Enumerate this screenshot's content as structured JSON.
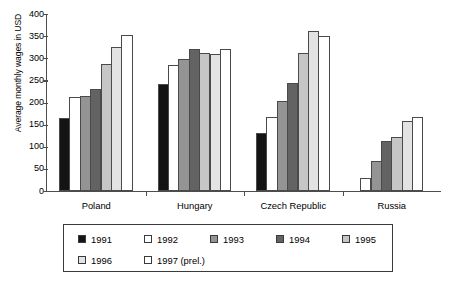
{
  "chart_data": {
    "type": "bar",
    "title": "",
    "subtitle": "",
    "xlabel": "",
    "ylabel": "Average monthly wages in USD",
    "ylim": [
      0,
      400
    ],
    "yticks": [
      0,
      50,
      100,
      150,
      200,
      250,
      300,
      350,
      400
    ],
    "grid": false,
    "legend_position": "bottom",
    "categories": [
      "Poland",
      "Hungary",
      "Czech Republic",
      "Russia"
    ],
    "series": [
      {
        "name": "1991",
        "color": "#141414",
        "values": [
          165,
          241,
          131,
          null
        ]
      },
      {
        "name": "1992",
        "color": "#ffffff",
        "values": [
          212,
          284,
          167,
          29
        ]
      },
      {
        "name": "1993",
        "color": "#949494",
        "values": [
          215,
          298,
          203,
          68
        ]
      },
      {
        "name": "1994",
        "color": "#636363",
        "values": [
          231,
          320,
          243,
          113
        ]
      },
      {
        "name": "1995",
        "color": "#c6c6c6",
        "values": [
          287,
          312,
          312,
          121
        ]
      },
      {
        "name": "1996",
        "color": "#e3e3e3",
        "values": [
          325,
          310,
          361,
          159
        ]
      },
      {
        "name": "1997 (prel.)",
        "color": "#ffffff",
        "values": [
          352,
          320,
          351,
          168
        ]
      }
    ]
  },
  "legend": {
    "items": [
      {
        "label": "1991",
        "color": "#141414"
      },
      {
        "label": "1992",
        "color": "#ffffff"
      },
      {
        "label": "1993",
        "color": "#949494"
      },
      {
        "label": "1994",
        "color": "#636363"
      },
      {
        "label": "1995",
        "color": "#c6c6c6"
      },
      {
        "label": "1996",
        "color": "#e3e3e3"
      },
      {
        "label": "1997 (prel.)",
        "color": "#ffffff"
      }
    ]
  },
  "colors": {
    "axis": "#4d4d4d",
    "bar_outline": "#4a4a4a",
    "legend_border": "#3a3a3a",
    "background": "#ffffff"
  }
}
